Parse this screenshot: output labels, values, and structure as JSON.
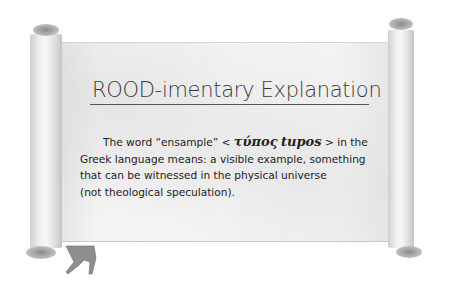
{
  "scroll": {
    "title": "ROOD-imentary Explanation",
    "paragraph": {
      "line1_prefix": "The word “ensample” < ",
      "greek_word": "τύπος",
      "transliteration": "tupos",
      "line1_suffix": " > in the",
      "line2": "Greek language means: a visible example, something",
      "line3": "that can be witnessed in the physical universe",
      "line4": "(not theological speculation)."
    }
  },
  "colors": {
    "background": "#ffffff",
    "paper": "#f4f4f4",
    "roll": "#e2e2e2",
    "text": "#222222",
    "title": "#3a3a3a"
  }
}
